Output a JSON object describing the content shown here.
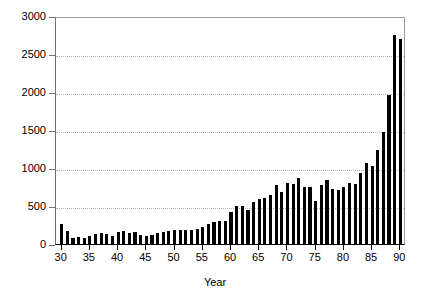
{
  "chart_data": {
    "type": "bar",
    "title": "",
    "xlabel": "Year",
    "ylabel": "",
    "xlim": [
      29.0,
      91.0
    ],
    "ylim": [
      0,
      3000
    ],
    "grid": true,
    "legend": null,
    "y_ticks": [
      0,
      500,
      1000,
      1500,
      2000,
      2500,
      3000
    ],
    "y_tick_labels": [
      "0",
      "500",
      "1000",
      "1500",
      "2000",
      "2500",
      "3000"
    ],
    "x_ticks": [
      30,
      35,
      40,
      45,
      50,
      55,
      60,
      65,
      70,
      75,
      80,
      85,
      90
    ],
    "x_tick_labels": [
      "30",
      "35",
      "40",
      "45",
      "50",
      "55",
      "60",
      "65",
      "70",
      "75",
      "80",
      "85",
      "90"
    ],
    "bar_color": "#000000",
    "categories": [
      30,
      31,
      32,
      33,
      34,
      35,
      36,
      37,
      38,
      39,
      40,
      41,
      42,
      43,
      44,
      45,
      46,
      47,
      48,
      49,
      50,
      51,
      52,
      53,
      54,
      55,
      56,
      57,
      58,
      59,
      60,
      61,
      62,
      63,
      64,
      65,
      66,
      67,
      68,
      69,
      70,
      71,
      72,
      73,
      74,
      75,
      76,
      77,
      78,
      79,
      80,
      81,
      82,
      83,
      84,
      85,
      86,
      87,
      88,
      89,
      90
    ],
    "values": [
      260,
      175,
      80,
      95,
      85,
      110,
      130,
      150,
      135,
      100,
      155,
      165,
      150,
      155,
      115,
      110,
      120,
      140,
      155,
      175,
      185,
      190,
      185,
      180,
      200,
      230,
      265,
      295,
      300,
      300,
      420,
      500,
      505,
      450,
      555,
      590,
      610,
      650,
      775,
      680,
      800,
      790,
      870,
      745,
      750,
      560,
      770,
      840,
      720,
      710,
      750,
      800,
      790,
      940,
      1065,
      1030,
      1235,
      1470,
      1960,
      2750,
      2700
    ]
  }
}
